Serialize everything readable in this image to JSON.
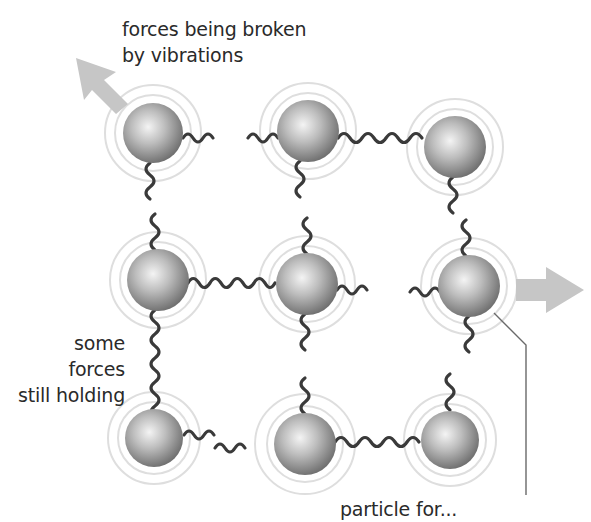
{
  "diagram": {
    "type": "particle-lattice",
    "labels": {
      "top_line1": "forces being broken",
      "top_line2": "by vibrations",
      "left_line1": "some forces",
      "left_line2": "still holding",
      "bottom_partial": "particle for..."
    },
    "colors": {
      "sphere_light": "#f2f2f2",
      "sphere_mid": "#b5b5b5",
      "sphere_dark": "#6e6e6e",
      "spring": "#3a3a3a",
      "arrow": "#c4c4c4",
      "ring": "#dcdcdc",
      "text": "#2a2a2a"
    },
    "particles": [
      {
        "row": 1,
        "col": 1,
        "cx": 153,
        "cy": 133
      },
      {
        "row": 1,
        "col": 2,
        "cx": 308,
        "cy": 131
      },
      {
        "row": 1,
        "col": 3,
        "cx": 455,
        "cy": 147
      },
      {
        "row": 2,
        "col": 1,
        "cx": 158,
        "cy": 280
      },
      {
        "row": 2,
        "col": 2,
        "cx": 307,
        "cy": 284
      },
      {
        "row": 2,
        "col": 3,
        "cx": 469,
        "cy": 286
      },
      {
        "row": 3,
        "col": 1,
        "cx": 154,
        "cy": 438
      },
      {
        "row": 3,
        "col": 2,
        "cx": 305,
        "cy": 444
      },
      {
        "row": 3,
        "col": 3,
        "cx": 450,
        "cy": 440
      }
    ],
    "arrows": [
      {
        "name": "escape-arrow-top-left",
        "direction": "up-left"
      },
      {
        "name": "escape-arrow-right",
        "direction": "right"
      }
    ]
  }
}
